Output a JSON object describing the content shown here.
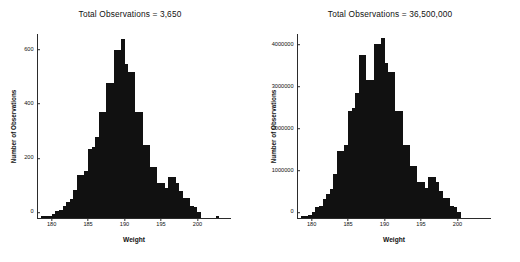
{
  "figure": {
    "background": "#ffffff",
    "bar_color": "#111111",
    "axis_color": "#2b2b2b"
  },
  "panels": [
    {
      "id": "left",
      "title": "Total Observations = 3,650"
    },
    {
      "id": "right",
      "title": "Total Observations = 36,500,000"
    }
  ],
  "chart_data": [
    {
      "type": "bar",
      "title": "Total Observations = 3,650",
      "xlabel": "Weight",
      "ylabel": "Number of Observations",
      "xlim": [
        178.0,
        203.5
      ],
      "ylim": [
        0,
        680
      ],
      "xticks": [
        180,
        185,
        190,
        195,
        200
      ],
      "xticklabels": [
        "180",
        "185",
        "190",
        "195",
        "200"
      ],
      "yticks": [
        0,
        200,
        400,
        600
      ],
      "yticklabels": [
        "0",
        "200",
        "400",
        "600"
      ],
      "grid": false,
      "legend": null,
      "bin_width": 0.5,
      "bin_starts": [
        178.5,
        179.0,
        179.5,
        180.0,
        180.5,
        181.0,
        181.5,
        182.0,
        182.5,
        183.0,
        183.5,
        184.0,
        184.5,
        185.0,
        185.5,
        186.0,
        186.5,
        187.0,
        187.5,
        188.0,
        188.5,
        189.0,
        189.5,
        190.0,
        190.5,
        191.0,
        191.5,
        192.0,
        192.5,
        193.0,
        193.5,
        194.0,
        194.5,
        195.0,
        195.5,
        196.0,
        196.5,
        197.0,
        197.5,
        198.0,
        198.5,
        199.0,
        199.5,
        200.0,
        202.5
      ],
      "values": [
        6,
        6,
        8,
        14,
        26,
        28,
        45,
        58,
        70,
        105,
        160,
        160,
        175,
        255,
        262,
        300,
        390,
        390,
        500,
        500,
        620,
        620,
        660,
        570,
        540,
        540,
        390,
        390,
        270,
        270,
        190,
        190,
        130,
        130,
        110,
        150,
        150,
        130,
        100,
        75,
        75,
        45,
        40,
        22,
        6
      ]
    },
    {
      "type": "bar",
      "title": "Total Observations = 36,500,000",
      "xlabel": "Weight",
      "ylabel": "Number of Observations",
      "xlim": [
        178.0,
        203.5
      ],
      "ylim": [
        0,
        4400000
      ],
      "xticks": [
        180,
        185,
        190,
        195,
        200
      ],
      "xticklabels": [
        "180",
        "185",
        "190",
        "195",
        "200"
      ],
      "yticks": [
        0,
        1000000,
        2000000,
        3000000,
        4000000
      ],
      "yticklabels": [
        "0",
        "1000000",
        "2000000",
        "3000000",
        "4000000"
      ],
      "grid": false,
      "legend": null,
      "bin_width": 0.5,
      "bin_starts": [
        178.5,
        179.0,
        179.5,
        180.0,
        180.5,
        181.0,
        181.5,
        182.0,
        182.5,
        183.0,
        183.5,
        184.0,
        184.5,
        185.0,
        185.5,
        186.0,
        186.5,
        187.0,
        187.5,
        188.0,
        188.5,
        189.0,
        189.5,
        190.0,
        190.5,
        191.0,
        191.5,
        192.0,
        192.5,
        193.0,
        193.5,
        194.0,
        194.5,
        195.0,
        195.5,
        196.0,
        196.5,
        197.0,
        197.5,
        198.0,
        198.5,
        199.0,
        199.5,
        200.0
      ],
      "values": [
        60000,
        60000,
        80000,
        140000,
        260000,
        280000,
        450000,
        580000,
        700000,
        1050000,
        1600000,
        1600000,
        1750000,
        2550000,
        2620000,
        3000000,
        3900000,
        3900000,
        3300000,
        3300000,
        4150000,
        4150000,
        4300000,
        3700000,
        3500000,
        3500000,
        2550000,
        2550000,
        1750000,
        1750000,
        1250000,
        1250000,
        850000,
        850000,
        720000,
        980000,
        980000,
        850000,
        650000,
        490000,
        490000,
        290000,
        260000,
        140000
      ]
    }
  ]
}
